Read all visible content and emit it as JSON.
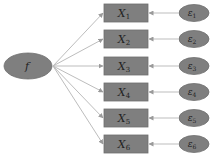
{
  "diagram": {
    "type": "factor-model",
    "colors": {
      "node_fill": "#7f7f7f",
      "node_stroke": "#6e6e6e",
      "arrow": "#bdbdbd",
      "text": "#222222",
      "background": "#ffffff"
    },
    "factor": {
      "id": "f",
      "label": "f"
    },
    "indicators": [
      {
        "id": "X1",
        "base": "X",
        "sub": "1",
        "error": {
          "base": "ε",
          "sub": "1"
        }
      },
      {
        "id": "X2",
        "base": "X",
        "sub": "2",
        "error": {
          "base": "ε",
          "sub": "2"
        }
      },
      {
        "id": "X3",
        "base": "X",
        "sub": "3",
        "error": {
          "base": "ε",
          "sub": "3"
        }
      },
      {
        "id": "X4",
        "base": "X",
        "sub": "4",
        "error": {
          "base": "ε",
          "sub": "4"
        }
      },
      {
        "id": "X5",
        "base": "X",
        "sub": "5",
        "error": {
          "base": "ε",
          "sub": "5"
        }
      },
      {
        "id": "X6",
        "base": "X",
        "sub": "6",
        "error": {
          "base": "ε",
          "sub": "6"
        }
      }
    ],
    "edges": [
      {
        "from": "f",
        "to": "X1"
      },
      {
        "from": "f",
        "to": "X2"
      },
      {
        "from": "f",
        "to": "X3"
      },
      {
        "from": "f",
        "to": "X4"
      },
      {
        "from": "f",
        "to": "X5"
      },
      {
        "from": "f",
        "to": "X6"
      },
      {
        "from": "ε1",
        "to": "X1"
      },
      {
        "from": "ε2",
        "to": "X2"
      },
      {
        "from": "ε3",
        "to": "X3"
      },
      {
        "from": "ε4",
        "to": "X4"
      },
      {
        "from": "ε5",
        "to": "X5"
      },
      {
        "from": "ε6",
        "to": "X6"
      }
    ]
  }
}
